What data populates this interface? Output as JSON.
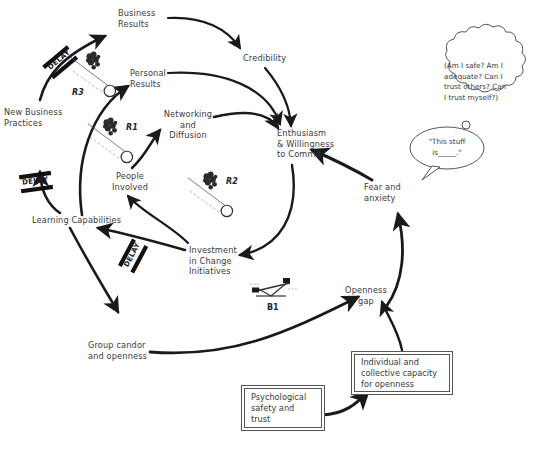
{
  "diagram": {
    "stroke_color": "#1a1a1a",
    "text_color": "#3a3a3a",
    "background": "#ffffff"
  },
  "nodes": [
    {
      "id": "business-results",
      "label": "Business\nResults"
    },
    {
      "id": "credibility",
      "label": "Credibility"
    },
    {
      "id": "personal-results",
      "label": "Personal\nResults"
    },
    {
      "id": "networking-diffusion",
      "label": "Networking\nand\nDiffusion"
    },
    {
      "id": "enthusiasm-commit",
      "label": "Enthusiasm\n& Willingness\nto Commit"
    },
    {
      "id": "new-business-practices",
      "label": "New Business\nPractices"
    },
    {
      "id": "people-involved",
      "label": "People\nInvolved"
    },
    {
      "id": "learning-capabilities",
      "label": "Learning Capabilities"
    },
    {
      "id": "investment-change",
      "label": "Investment\nin Change\nInitiatives"
    },
    {
      "id": "group-candor",
      "label": "Group candor\nand openness"
    },
    {
      "id": "fear-anxiety",
      "label": "Fear and\nanxiety"
    },
    {
      "id": "openness-gap",
      "label": "Openness\ngap"
    }
  ],
  "boxes": [
    {
      "id": "psych-safety",
      "label": "Psychological\nsafety and\ntrust"
    },
    {
      "id": "capacity-openness",
      "label": "Individual and\ncollective capacity\nfor openness"
    }
  ],
  "loops": [
    {
      "id": "r3",
      "label": "R3",
      "type": "reinforcing",
      "icon": "snowball-rolling-icon"
    },
    {
      "id": "r1",
      "label": "R1",
      "type": "reinforcing",
      "icon": "snowball-rolling-icon"
    },
    {
      "id": "r2",
      "label": "R2",
      "type": "reinforcing",
      "icon": "snowball-rolling-icon"
    },
    {
      "id": "b1",
      "label": "B1",
      "type": "balancing",
      "icon": "seesaw-balance-icon"
    }
  ],
  "delays": [
    {
      "id": "delay-top",
      "label": "DELAY"
    },
    {
      "id": "delay-left",
      "label": "DELAY"
    },
    {
      "id": "delay-bottom",
      "label": "DELAY"
    }
  ],
  "bubbles": [
    {
      "id": "thought-bubble",
      "type": "thought",
      "text": "(Am I safe? Am I\nadequate? Can I\ntrust others? Can\nI trust myself?)"
    },
    {
      "id": "speech-bubble",
      "type": "speech",
      "text": "\"This stuff\nis_____.\""
    }
  ]
}
